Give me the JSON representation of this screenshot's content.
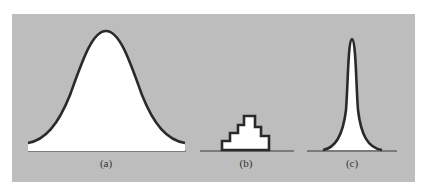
{
  "figure": {
    "panels": [
      {
        "id": "a",
        "label": "(a)",
        "shape": "wide bell curve"
      },
      {
        "id": "b",
        "label": "(b)",
        "shape": "stepped histogram"
      },
      {
        "id": "c",
        "label": "(c)",
        "shape": "narrow peaked curve"
      }
    ],
    "colors": {
      "background": "#bdbdbd",
      "fill": "#ffffff",
      "stroke": "#2a2a2a"
    }
  }
}
